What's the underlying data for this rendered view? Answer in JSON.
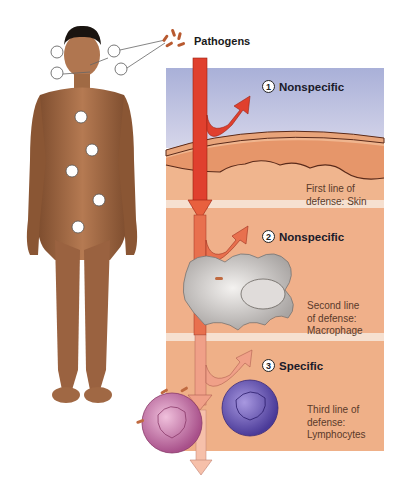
{
  "figure": {
    "pathogen_label": "Pathogens",
    "lines_of_defense": [
      {
        "number": "1",
        "type": "Nonspecific",
        "description_line1": "First line of",
        "description_line2": "defense: Skin",
        "description_line3": ""
      },
      {
        "number": "2",
        "type": "Nonspecific",
        "description_line1": "Second line",
        "description_line2": "of defense:",
        "description_line3": "Macrophage"
      },
      {
        "number": "3",
        "type": "Specific",
        "description_line1": "Third line of",
        "description_line2": "defense:",
        "description_line3": "Lymphocytes"
      }
    ],
    "infection_sites_count": 10
  },
  "colors": {
    "sky": "#b8bedf",
    "skin_band": "#e69a70",
    "tissue": "#f0b58e",
    "separator": "#f6e0d0",
    "arrow_red": "#e0402e",
    "arrow_light": "#f0a088",
    "body_skin": "#a86a44",
    "macrophage": "#d8d4d0",
    "lymph_pink": "#c47aa8",
    "lymph_purple": "#6a58b0"
  }
}
